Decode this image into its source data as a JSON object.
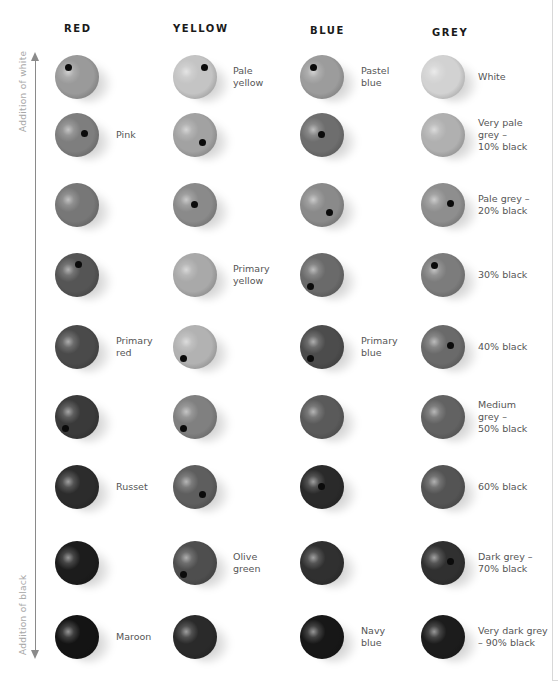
{
  "columns": [
    {
      "key": "red",
      "header": "RED"
    },
    {
      "key": "yellow",
      "header": "YELLOW"
    },
    {
      "key": "blue",
      "header": "BLUE"
    },
    {
      "key": "grey",
      "header": "GREY"
    }
  ],
  "axis": {
    "top_label": "Addition of white",
    "bottom_label": "Addition of black"
  },
  "red": {
    "balls": [
      {
        "tone": "#9a9a9a",
        "hole": "tl",
        "label": ""
      },
      {
        "tone": "#7e7e7e",
        "hole": "cr",
        "label": "Pink"
      },
      {
        "tone": "#777777",
        "hole": "",
        "label": ""
      },
      {
        "tone": "#555555",
        "hole": "tc",
        "label": ""
      },
      {
        "tone": "#4a4a4a",
        "hole": "",
        "label": "Primary\nred"
      },
      {
        "tone": "#3a3a3a",
        "hole": "bl",
        "label": ""
      },
      {
        "tone": "#2c2c2c",
        "hole": "",
        "label": "Russet"
      },
      {
        "tone": "#1c1c1c",
        "hole": "",
        "label": ""
      },
      {
        "tone": "#141414",
        "hole": "",
        "label": "Maroon"
      }
    ]
  },
  "yellow": {
    "balls": [
      {
        "tone": "#c4c4c4",
        "hole": "tr",
        "label": "Pale\nyellow"
      },
      {
        "tone": "#a2a2a2",
        "hole": "br",
        "label": ""
      },
      {
        "tone": "#8a8a8a",
        "hole": "c",
        "label": ""
      },
      {
        "tone": "#a9a9a9",
        "hole": "",
        "label": "Primary\nyellow"
      },
      {
        "tone": "#b2b2b2",
        "hole": "bl",
        "label": ""
      },
      {
        "tone": "#808080",
        "hole": "bl",
        "label": ""
      },
      {
        "tone": "#5e5e5e",
        "hole": "br",
        "label": ""
      },
      {
        "tone": "#4e4e4e",
        "hole": "bl",
        "label": "Olive\ngreen"
      },
      {
        "tone": "#2a2a2a",
        "hole": "",
        "label": ""
      }
    ]
  },
  "blue": {
    "balls": [
      {
        "tone": "#9c9c9c",
        "hole": "tl",
        "label": "Pastel\nblue"
      },
      {
        "tone": "#6e6e6e",
        "hole": "c",
        "label": ""
      },
      {
        "tone": "#8a8a8a",
        "hole": "br",
        "label": ""
      },
      {
        "tone": "#6a6a6a",
        "hole": "bl",
        "label": ""
      },
      {
        "tone": "#4c4c4c",
        "hole": "bl",
        "label": "Primary\nblue"
      },
      {
        "tone": "#5a5a5a",
        "hole": "",
        "label": ""
      },
      {
        "tone": "#2a2a2a",
        "hole": "c",
        "label": ""
      },
      {
        "tone": "#303030",
        "hole": "",
        "label": ""
      },
      {
        "tone": "#171717",
        "hole": "",
        "label": "Navy\nblue"
      }
    ]
  },
  "grey": {
    "balls": [
      {
        "tone": "#d2d2d2",
        "hole": "",
        "label": "White"
      },
      {
        "tone": "#b0b0b0",
        "hole": "",
        "label": "Very pale\ngrey –\n10% black"
      },
      {
        "tone": "#8e8e8e",
        "hole": "cr",
        "label": "Pale grey –\n20% black"
      },
      {
        "tone": "#7c7c7c",
        "hole": "tl",
        "label": "30% black"
      },
      {
        "tone": "#6a6a6a",
        "hole": "cr",
        "label": "40% black"
      },
      {
        "tone": "#626262",
        "hole": "",
        "label": "Medium\ngrey –\n50% black"
      },
      {
        "tone": "#545454",
        "hole": "",
        "label": "60% black"
      },
      {
        "tone": "#303030",
        "hole": "cr",
        "label": "Dark grey –\n70% black"
      },
      {
        "tone": "#1c1c1c",
        "hole": "",
        "label": "Very dark grey\n– 90% black"
      }
    ]
  }
}
